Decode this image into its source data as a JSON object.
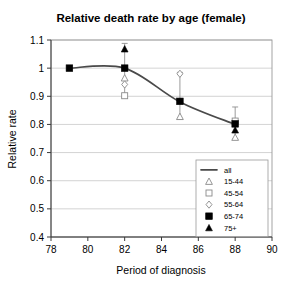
{
  "chart_data": {
    "type": "scatter",
    "title": "Relative death rate by age (female)",
    "xlabel": "Period of diagnosis",
    "ylabel": "Relative rate",
    "xlim": [
      78,
      90
    ],
    "ylim": [
      0.4,
      1.1
    ],
    "xticks": [
      "78",
      "80",
      "82",
      "84",
      "86",
      "88",
      "90"
    ],
    "xtick_values": [
      78,
      80,
      82,
      84,
      86,
      88,
      90
    ],
    "yticks": [
      "0.4",
      "0.5",
      "0.6",
      "0.7",
      "0.8",
      "0.9",
      "1",
      "1.1"
    ],
    "ytick_values": [
      0.4,
      0.5,
      0.6,
      0.7,
      0.8,
      0.9,
      1.0,
      1.1
    ],
    "grid": true,
    "legend_position": "lower right",
    "series": [
      {
        "name": "all",
        "marker": "line",
        "x": [
          79,
          82,
          85,
          88
        ],
        "values": [
          1.0,
          1.0,
          0.88,
          0.8
        ]
      },
      {
        "name": "15-44",
        "marker": "open-triangle",
        "x": [
          82,
          85,
          88
        ],
        "values": [
          0.965,
          0.828,
          0.754
        ]
      },
      {
        "name": "45-54",
        "marker": "open-square",
        "x": [
          82,
          88
        ],
        "values": [
          0.902,
          0.812
        ]
      },
      {
        "name": "55-64",
        "marker": "open-diamond",
        "x": [
          82,
          85
        ],
        "values": [
          0.942,
          0.98
        ]
      },
      {
        "name": "65-74",
        "marker": "filled-square",
        "x": [
          79,
          82,
          85,
          88
        ],
        "values": [
          1.0,
          1.0,
          0.882,
          0.802
        ]
      },
      {
        "name": "75+",
        "marker": "filled-triangle",
        "x": [
          82,
          88
        ],
        "values": [
          1.068,
          0.78
        ]
      }
    ],
    "error_bars": [
      {
        "x": 82,
        "low": 0.895,
        "high": 1.088
      },
      {
        "x": 85,
        "low": 0.818,
        "high": 0.985
      },
      {
        "x": 88,
        "low": 0.748,
        "high": 0.862
      }
    ],
    "legend_entries": [
      {
        "label": "all",
        "marker": "line"
      },
      {
        "label": "15-44",
        "marker": "open-triangle"
      },
      {
        "label": "45-54",
        "marker": "open-square"
      },
      {
        "label": "55-64",
        "marker": "open-diamond"
      },
      {
        "label": "65-74",
        "marker": "filled-square"
      },
      {
        "label": "75+",
        "marker": "filled-triangle"
      }
    ],
    "colors": {
      "line": "#4a4a4a",
      "grid": "#c8c8c8",
      "frame": "#9a9a9a",
      "marker_open_stroke": "#8a8a8a",
      "marker_fill": "#000000",
      "error_bar": "#8f8f8f",
      "text": "#000000",
      "background": "#ffffff"
    }
  }
}
